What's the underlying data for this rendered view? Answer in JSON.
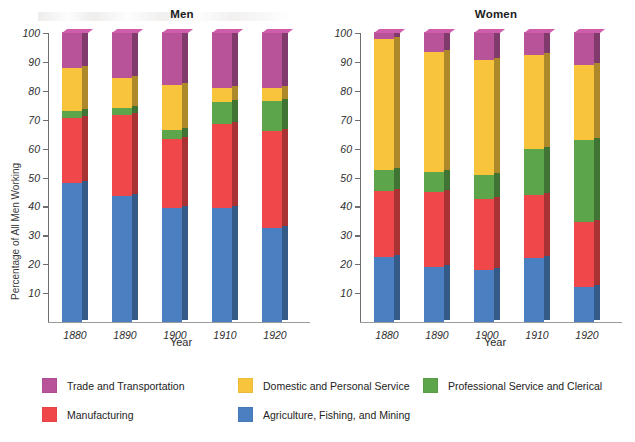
{
  "figure": {
    "xlabel": "Year",
    "series_colors": {
      "trade": "#b8539a",
      "domestic": "#f8c43c",
      "professional": "#5ca54a",
      "manufacturing": "#f0474a",
      "agriculture": "#4a80c2"
    }
  },
  "panels": [
    {
      "key": "men",
      "title": "Men",
      "ylabel": "Percentage of All Men Working",
      "xlabel": "Year"
    },
    {
      "key": "women",
      "title": "Women",
      "ylabel": "Percentage of All Women Working",
      "xlabel": "Year"
    }
  ],
  "legend": {
    "items": [
      {
        "label": "Trade and Transportation",
        "color": "#b8539a",
        "col": 0,
        "row": 0
      },
      {
        "label": "Domestic and Personal Service",
        "color": "#f8c43c",
        "col": 1,
        "row": 0
      },
      {
        "label": "Professional Service and Clerical",
        "color": "#5ca54a",
        "col": 2,
        "row": 0
      },
      {
        "label": "Manufacturing",
        "color": "#f0474a",
        "col": 0,
        "row": 1
      },
      {
        "label": "Agriculture, Fishing, and Mining",
        "color": "#4a80c2",
        "col": 1,
        "row": 1
      }
    ]
  },
  "chart_data": [
    {
      "type": "bar",
      "subtype": "stacked-100",
      "title": "Men",
      "xlabel": "Year",
      "ylabel": "Percentage of All Men Working",
      "categories": [
        "1880",
        "1890",
        "1900",
        "1910",
        "1920"
      ],
      "ylim": [
        0,
        100
      ],
      "yticks": [
        10,
        20,
        30,
        40,
        50,
        60,
        70,
        80,
        90,
        100
      ],
      "grid": false,
      "legend_position": "below-figure",
      "stack_order_bottom_to_top": [
        "Agriculture, Fishing, and Mining",
        "Manufacturing",
        "Professional Service and Clerical",
        "Domestic and Personal Service",
        "Trade and Transportation"
      ],
      "series": [
        {
          "name": "Agriculture, Fishing, and Mining",
          "color": "#4a80c2",
          "values": [
            48.0,
            43.5,
            39.5,
            39.5,
            32.5
          ]
        },
        {
          "name": "Manufacturing",
          "color": "#f0474a",
          "values": [
            22.5,
            28.0,
            24.0,
            29.0,
            33.5
          ]
        },
        {
          "name": "Professional Service and Clerical",
          "color": "#5ca54a",
          "values": [
            2.5,
            2.5,
            3.0,
            7.5,
            10.5
          ]
        },
        {
          "name": "Domestic and Personal Service",
          "color": "#f8c43c",
          "values": [
            15.0,
            10.5,
            15.5,
            5.0,
            4.5
          ]
        },
        {
          "name": "Trade and Transportation",
          "color": "#b8539a",
          "values": [
            12.0,
            15.5,
            18.0,
            19.0,
            19.0
          ]
        }
      ],
      "cumulative_tops": [
        [
          48.0,
          70.5,
          73.0,
          88.0,
          100.0
        ],
        [
          43.5,
          71.5,
          74.0,
          84.5,
          100.0
        ],
        [
          39.5,
          63.5,
          66.5,
          82.0,
          100.0
        ],
        [
          39.5,
          68.5,
          76.0,
          81.0,
          100.0
        ],
        [
          32.5,
          66.0,
          76.5,
          81.0,
          100.0
        ]
      ]
    },
    {
      "type": "bar",
      "subtype": "stacked-100",
      "title": "Women",
      "xlabel": "Year",
      "ylabel": "Percentage of All Women Working",
      "categories": [
        "1880",
        "1890",
        "1900",
        "1910",
        "1920"
      ],
      "ylim": [
        0,
        100
      ],
      "yticks": [
        10,
        20,
        30,
        40,
        50,
        60,
        70,
        80,
        90,
        100
      ],
      "grid": false,
      "legend_position": "below-figure",
      "stack_order_bottom_to_top": [
        "Agriculture, Fishing, and Mining",
        "Manufacturing",
        "Professional Service and Clerical",
        "Domestic and Personal Service",
        "Trade and Transportation"
      ],
      "series": [
        {
          "name": "Agriculture, Fishing, and Mining",
          "color": "#4a80c2",
          "values": [
            22.5,
            19.0,
            18.0,
            22.0,
            12.0
          ]
        },
        {
          "name": "Manufacturing",
          "color": "#f0474a",
          "values": [
            23.0,
            26.0,
            24.5,
            22.0,
            22.5
          ]
        },
        {
          "name": "Professional Service and Clerical",
          "color": "#5ca54a",
          "values": [
            7.0,
            7.0,
            8.5,
            16.0,
            28.5
          ]
        },
        {
          "name": "Domestic and Personal Service",
          "color": "#f8c43c",
          "values": [
            45.5,
            41.5,
            39.5,
            32.5,
            26.0
          ]
        },
        {
          "name": "Trade and Transportation",
          "color": "#b8539a",
          "values": [
            2.0,
            6.5,
            9.5,
            7.5,
            11.0
          ]
        }
      ],
      "cumulative_tops": [
        [
          22.5,
          45.5,
          52.5,
          98.0,
          100.0
        ],
        [
          19.0,
          45.0,
          52.0,
          93.5,
          100.0
        ],
        [
          18.0,
          42.5,
          51.0,
          90.5,
          100.0
        ],
        [
          22.0,
          44.0,
          60.0,
          92.5,
          100.0
        ],
        [
          12.0,
          34.5,
          63.0,
          89.0,
          100.0
        ]
      ]
    }
  ]
}
